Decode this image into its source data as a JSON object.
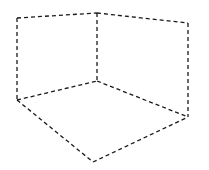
{
  "diagram": {
    "type": "isometric-corner",
    "stroke_color": "#1a1a1a",
    "background": "#ffffff",
    "vertices": {
      "top_left": [
        17,
        18
      ],
      "top_center": [
        97,
        13
      ],
      "top_right": [
        188,
        23
      ],
      "inner_corner": [
        97,
        81
      ],
      "bottom_left": [
        17,
        100
      ],
      "bottom_right": [
        188,
        117
      ],
      "bottom_front": [
        93,
        162
      ]
    },
    "edges": [
      {
        "name": "left-wall-top-edge",
        "from": "top_left",
        "to": "top_center"
      },
      {
        "name": "right-wall-top-edge",
        "from": "top_center",
        "to": "top_right"
      },
      {
        "name": "left-wall-outer-edge",
        "from": "top_left",
        "to": "bottom_left"
      },
      {
        "name": "corner-vertical-edge",
        "from": "top_center",
        "to": "inner_corner"
      },
      {
        "name": "right-wall-outer-edge",
        "from": "top_right",
        "to": "bottom_right"
      },
      {
        "name": "left-wall-floor-edge",
        "from": "bottom_left",
        "to": "inner_corner"
      },
      {
        "name": "right-wall-floor-edge",
        "from": "inner_corner",
        "to": "bottom_right"
      },
      {
        "name": "floor-left-front-edge",
        "from": "bottom_left",
        "to": "bottom_front"
      },
      {
        "name": "floor-right-front-edge",
        "from": "bottom_front",
        "to": "bottom_right"
      }
    ]
  }
}
